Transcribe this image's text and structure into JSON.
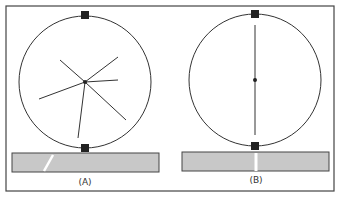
{
  "figure": {
    "panels": [
      {
        "id": "A",
        "label": "(A)",
        "circle": {
          "cx": 85,
          "cy": 82,
          "r": 66
        },
        "center_dot": true,
        "spokes": [
          [
            60,
            60
          ],
          [
            118,
            57
          ],
          [
            118,
            80
          ],
          [
            126,
            120
          ],
          [
            39,
            99
          ],
          [
            78,
            138
          ]
        ],
        "bar": {
          "x": 12,
          "y": 153,
          "w": 147,
          "h": 19,
          "mark": "slanted"
        }
      },
      {
        "id": "B",
        "label": "(B)",
        "circle": {
          "cx": 255,
          "cy": 80,
          "r": 66
        },
        "center_dot": true,
        "spokes": [
          [
            255,
            25
          ],
          [
            255,
            135
          ]
        ],
        "bar": {
          "x": 182,
          "y": 152,
          "w": 147,
          "h": 19,
          "mark": "vertical"
        }
      }
    ],
    "colors": {
      "line": "#333333",
      "bar_fill": "#c8c8c8",
      "frame": "#444444"
    }
  }
}
